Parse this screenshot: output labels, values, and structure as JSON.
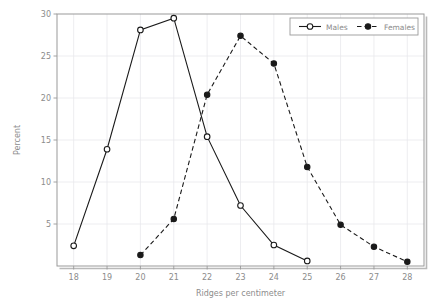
{
  "chart_data": {
    "type": "line",
    "title": "",
    "xlabel": "Ridges per centimeter",
    "ylabel": "Percent",
    "x": [
      18,
      19,
      20,
      21,
      22,
      23,
      24,
      25,
      26,
      27,
      28
    ],
    "xticks": [
      "18",
      "19",
      "20",
      "21",
      "22",
      "23",
      "24",
      "25",
      "26",
      "27",
      "28"
    ],
    "yticks": [
      "5",
      "10",
      "15",
      "20",
      "25",
      "30"
    ],
    "ytick_values": [
      5,
      10,
      15,
      20,
      25,
      30
    ],
    "xlim": [
      17.5,
      28.5
    ],
    "ylim": [
      0,
      30
    ],
    "grid": true,
    "legend_position": "top-right",
    "series": [
      {
        "name": "Males",
        "marker": "open-circle",
        "linestyle": "solid",
        "color": "#1a1a1a",
        "x": [
          18,
          19,
          20,
          21,
          22,
          23,
          24,
          25
        ],
        "values": [
          2.4,
          13.9,
          28.1,
          29.5,
          15.4,
          7.2,
          2.5,
          0.6
        ]
      },
      {
        "name": "Females",
        "marker": "filled-circle",
        "linestyle": "dashed",
        "color": "#1a1a1a",
        "x": [
          20,
          21,
          22,
          23,
          24,
          25,
          26,
          27,
          28
        ],
        "values": [
          1.3,
          5.6,
          20.4,
          27.4,
          24.1,
          11.8,
          4.9,
          2.3,
          0.5
        ]
      }
    ]
  },
  "legend": {
    "entries": [
      {
        "label": "Males"
      },
      {
        "label": "Females"
      }
    ]
  },
  "axes": {
    "x_title": "Ridges per centimeter",
    "y_title": "Percent"
  }
}
